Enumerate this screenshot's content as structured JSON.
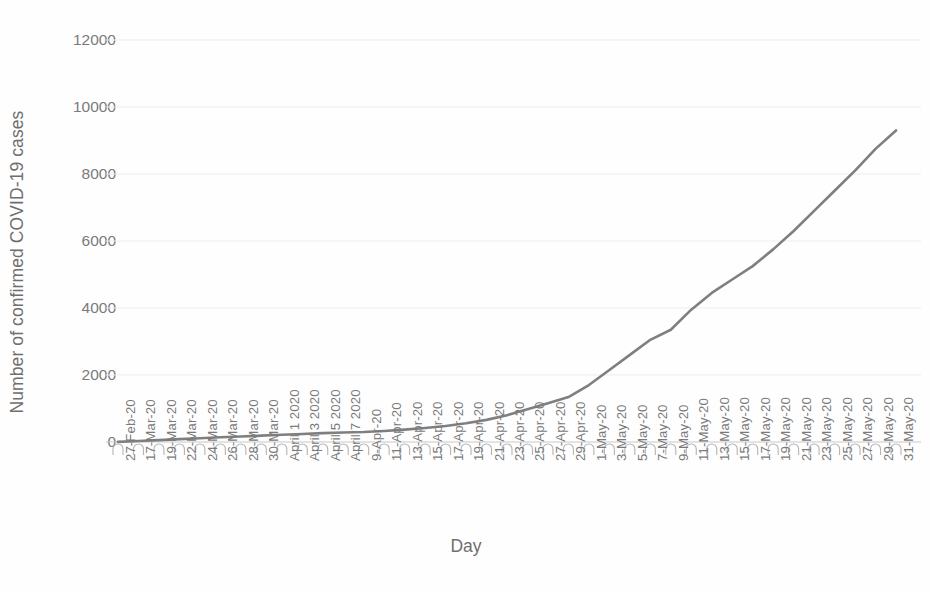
{
  "chart_data": {
    "type": "line",
    "title": "",
    "xlabel": "Day",
    "ylabel": "Number of confirmed COVID-19 cases",
    "ylim": [
      0,
      12000
    ],
    "y_ticks": [
      0,
      2000,
      4000,
      6000,
      8000,
      10000,
      12000
    ],
    "grid": "horizontal",
    "legend": "none",
    "line_color": "#7f7f7f",
    "categories": [
      "27-Feb-20",
      "17-Mar-20",
      "19-Mar-20",
      "22-Mar-20",
      "24-Mar-20",
      "26-Mar-20",
      "28-Mar-20",
      "30-Mar-20",
      "April 1 2020",
      "April 3 2020",
      "April 5 2020",
      "April 7 2020",
      "9-Apr-20",
      "11-Apr-20",
      "13-Apr-20",
      "15-Apr-20",
      "17-Apr-20",
      "19-Apr-20",
      "21-Apr-20",
      "23-Apr-20",
      "25-Apr-20",
      "27-Apr-20",
      "29-Apr-20",
      "1-May-20",
      "3-May-20",
      "5-May-20",
      "7-May-20",
      "9-May-20",
      "11-May-20",
      "13-May-20",
      "15-May-20",
      "17-May-20",
      "19-May-20",
      "21-May-20",
      "23-May-20",
      "25-May-20",
      "27-May-20",
      "29-May-20",
      "31-May-20"
    ],
    "values": [
      5,
      30,
      55,
      85,
      110,
      140,
      165,
      190,
      215,
      240,
      265,
      285,
      300,
      330,
      370,
      420,
      480,
      560,
      660,
      800,
      980,
      1160,
      1340,
      1700,
      2150,
      2600,
      3050,
      3350,
      3950,
      4450,
      4850,
      5250,
      5750,
      6300,
      6900,
      7500,
      8100,
      8750,
      9300
    ],
    "series_name": "Confirmed COVID-19 cases"
  }
}
